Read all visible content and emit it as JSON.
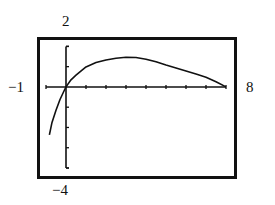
{
  "chart_data": {
    "type": "line",
    "title": "",
    "xlabel": "",
    "ylabel": "",
    "window": {
      "xmin": -1,
      "xmax": 8,
      "ymin": -4,
      "ymax": 2,
      "xscl": 1,
      "yscl": 1
    },
    "xlim": [
      -1,
      8
    ],
    "ylim": [
      -4,
      2
    ],
    "grid": false,
    "legend": null,
    "tick_labels": {
      "xmin": "−1",
      "xmax": "8",
      "ymin": "−4",
      "ymax": "2"
    },
    "series": [
      {
        "name": "f(x)",
        "x": [
          -0.83,
          -0.7,
          -0.5,
          -0.3,
          -0.1,
          0,
          0.25,
          0.5,
          1,
          1.5,
          2,
          2.5,
          3,
          3.5,
          4,
          4.5,
          5,
          5.5,
          6,
          6.5,
          7,
          7.5,
          8
        ],
        "values": [
          -2.36,
          -1.75,
          -1.15,
          -0.62,
          -0.2,
          0,
          0.35,
          0.58,
          0.99,
          1.2,
          1.33,
          1.42,
          1.46,
          1.45,
          1.37,
          1.24,
          1.08,
          0.94,
          0.79,
          0.64,
          0.48,
          0.26,
          0.0
        ]
      }
    ],
    "colors": {
      "line": "#111111",
      "axes": "#111111",
      "frame": "#111111",
      "background": "#ffffff"
    }
  },
  "labels": {
    "xmin": "−1",
    "xmax": "8",
    "ymin": "−4",
    "ymax": "2"
  }
}
